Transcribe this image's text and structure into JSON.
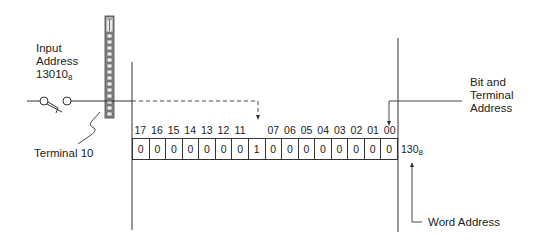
{
  "labels": {
    "input_address_line1": "Input",
    "input_address_line2": "Address",
    "input_address_value": "13010",
    "input_address_base": "8",
    "terminal": "Terminal 10",
    "bit_terminal_line1": "Bit and",
    "bit_terminal_line2": "Terminal",
    "bit_terminal_line3": "Address",
    "word_address_value": "130",
    "word_address_base": "8",
    "word_address": "Word Address"
  },
  "bit_numbers": [
    "17",
    "16",
    "15",
    "14",
    "13",
    "12",
    "11",
    "10",
    "07",
    "06",
    "05",
    "04",
    "03",
    "02",
    "01",
    "00"
  ],
  "bit_numbers_visible": [
    true,
    true,
    true,
    true,
    true,
    true,
    true,
    false,
    true,
    true,
    true,
    true,
    true,
    true,
    true,
    true
  ],
  "bit_values": [
    "0",
    "0",
    "0",
    "0",
    "0",
    "0",
    "0",
    "1",
    "0",
    "0",
    "0",
    "0",
    "0",
    "0",
    "0",
    "0"
  ],
  "colors": {
    "line": "#333333",
    "text": "#222222",
    "terminal_strip": "#777777"
  }
}
